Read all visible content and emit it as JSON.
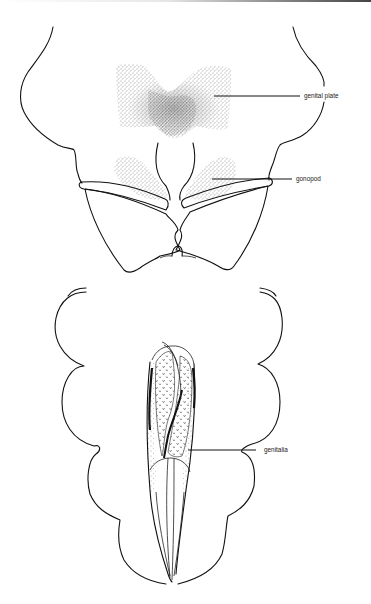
{
  "figure": {
    "upper_view": {
      "name": "ventral view of posterior segments",
      "labels": [
        {
          "id": "genital-plate",
          "text": "genital plate"
        },
        {
          "id": "gonopod",
          "text": "gonopod"
        }
      ]
    },
    "lower_view": {
      "name": "genitalia view",
      "labels": [
        {
          "id": "genitalia",
          "text": "genitalia"
        }
      ]
    }
  },
  "colors": {
    "ink": "#111111",
    "background": "#ffffff",
    "stipple": "#333333"
  }
}
